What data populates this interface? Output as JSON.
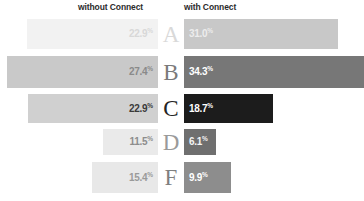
{
  "header": {
    "left_label": "without Connect",
    "right_label": "with Connect"
  },
  "chart_data": {
    "type": "bar",
    "title": "",
    "subtitle": "",
    "xlabel": "",
    "ylabel": "",
    "orientation": "horizontal",
    "style": "diverging-paired-bars",
    "grid": false,
    "legend_position": "top",
    "categories": [
      "A",
      "B",
      "C",
      "D",
      "F"
    ],
    "category_label": "Grade",
    "series": [
      {
        "name": "without Connect",
        "direction": "left",
        "values": [
          22.9,
          27.4,
          22.9,
          11.5,
          15.4
        ],
        "value_labels": [
          "22.9",
          "27.4",
          "22.9",
          "11.5",
          "15.4"
        ],
        "unit": "%",
        "colors": [
          "#f2f2f2",
          "#c9c9c9",
          "#d0d0d0",
          "#eaeaea",
          "#e8e8e8"
        ],
        "label_colors": [
          "#d8d8d8",
          "#8a8a8a",
          "#3a3a3a",
          "#8d8d8d",
          "#9a9a9a"
        ]
      },
      {
        "name": "with Connect",
        "direction": "right",
        "values": [
          31.0,
          34.3,
          18.7,
          6.1,
          9.9
        ],
        "value_labels": [
          "31.0",
          "34.3",
          "18.7",
          "6.1",
          "9.9"
        ],
        "unit": "%",
        "colors": [
          "#c8c8c8",
          "#777777",
          "#1c1c1c",
          "#6f6f6f",
          "#8d8d8d"
        ],
        "label_colors": [
          "#ededed",
          "#ffffff",
          "#ffffff",
          "#f4f4f4",
          "#ffffff"
        ]
      }
    ],
    "grade_colors": [
      "#d9d9d9",
      "#7a7a7a",
      "#242424",
      "#9a9a9a",
      "#7f7f7f"
    ],
    "rows": [
      {
        "grade": "A",
        "left_value": "22.9",
        "right_value": "31.0",
        "unit": "%",
        "left_bar_start_px": 27,
        "right_bar_end_px": 338,
        "top_px": 19,
        "height_px": 30
      },
      {
        "grade": "B",
        "left_value": "27.4",
        "right_value": "34.3",
        "unit": "%",
        "left_bar_start_px": 7,
        "right_bar_end_px": 364,
        "top_px": 56,
        "height_px": 32
      },
      {
        "grade": "C",
        "left_value": "22.9",
        "right_value": "18.7",
        "unit": "%",
        "left_bar_start_px": 28,
        "right_bar_end_px": 273,
        "top_px": 94,
        "height_px": 29
      },
      {
        "grade": "D",
        "left_value": "11.5",
        "right_value": "6.1",
        "unit": "%",
        "left_bar_start_px": 103,
        "right_bar_end_px": 216,
        "top_px": 129,
        "height_px": 26
      },
      {
        "grade": "F",
        "left_value": "15.4",
        "right_value": "9.9",
        "unit": "%",
        "left_bar_start_px": 92,
        "right_bar_end_px": 231,
        "top_px": 162,
        "height_px": 31
      }
    ]
  }
}
